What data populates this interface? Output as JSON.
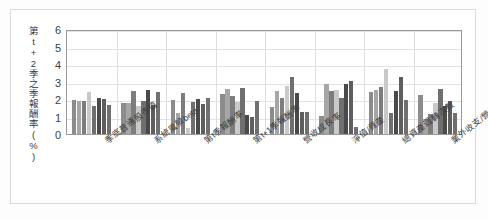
{
  "chart_data": {
    "type": "bar",
    "title": "",
    "xlabel": "",
    "ylabel": "第t+2季之季報酬率(%)",
    "ylim": [
      0,
      6
    ],
    "yticks": [
      "0",
      "1",
      "2",
      "3",
      "4",
      "5",
      "6"
    ],
    "grid": true,
    "legend": "none",
    "categories": [
      "季底普通股市值",
      "系統風險beta",
      "第t季報酬率",
      "第t+1季報酬率",
      "營收成長率",
      "淨值/資產",
      "總資產週轉次數",
      "業外收支/營收"
    ],
    "bars_per_group": 8,
    "series_colors": [
      "#8c8c8c",
      "#a6a6a6",
      "#7d7d7d",
      "#c9c9c9",
      "#6f6f6f",
      "#4a4a4a",
      "#5e5e5e",
      "#707070"
    ],
    "groups": [
      {
        "category": "季底普通股市值",
        "values": [
          1.95,
          1.9,
          1.88,
          2.42,
          1.58,
          2.05,
          2.02,
          1.68
        ]
      },
      {
        "category": "系統風險beta",
        "values": [
          1.8,
          1.78,
          2.45,
          1.58,
          1.88,
          2.5,
          1.65,
          2.4
        ]
      },
      {
        "category": "第t季報酬率",
        "values": [
          1.92,
          1.22,
          2.32,
          0.32,
          1.85,
          1.98,
          1.72,
          2.08
        ]
      },
      {
        "category": "第t+1季報酬率",
        "values": [
          2.28,
          2.55,
          2.18,
          1.85,
          2.62,
          1.08,
          0.95,
          1.88
        ]
      },
      {
        "category": "營收成長率",
        "values": [
          1.52,
          2.48,
          2.05,
          2.72,
          3.28,
          2.32,
          1.28,
          1.25
        ]
      },
      {
        "category": "淨值/資產",
        "values": [
          1.02,
          2.88,
          2.48,
          2.52,
          2.08,
          2.85,
          3.05,
          0.42
        ]
      },
      {
        "category": "總資產週轉次數",
        "values": [
          2.62,
          2.1,
          1.22,
          2.58,
          1.65,
          2.82,
          1.85,
          1.08
        ]
      },
      {
        "category": "業外收支/營收",
        "values": [
          2.22,
          0.85,
          1.12,
          1.68,
          2.62,
          1.32,
          2.45,
          2.52
        ]
      }
    ],
    "groups_extra": [
      {
        "category": "總資產週轉次數",
        "values": [
          2.42,
          2.5,
          2.7,
          3.7,
          1.22,
          2.48,
          3.25,
          1.95
        ]
      },
      {
        "category": "業外收支/營收",
        "values": [
          1.78,
          2.58,
          1.62,
          1.88,
          1.22,
          0.0,
          0.0,
          0.0
        ]
      }
    ]
  }
}
